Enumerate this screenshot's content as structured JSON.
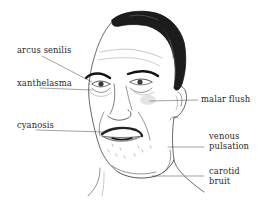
{
  "figure": {
    "ink_color": "#222222",
    "flush_color": "#e3e3e3",
    "lip_shade": "#bdbdbd"
  },
  "labels": {
    "arcus_senilis": "arcus senilis",
    "xanthelasma": "xanthelasma",
    "cyanosis": "cyanosis",
    "malar_flush": "malar flush",
    "venous_pulsation_line1": "venous",
    "venous_pulsation_line2": "pulsation",
    "carotid_bruit_line1": "carotid",
    "carotid_bruit_line2": "bruit"
  }
}
